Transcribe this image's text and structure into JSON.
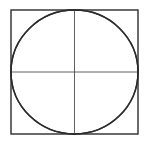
{
  "figure": {
    "background_color": "#ffffff",
    "stroke_color": "#2b2b2b",
    "thin_stroke_color": "#4f4f4f",
    "canvas": {
      "width": 147,
      "height": 146
    }
  },
  "geometry": {
    "square": {
      "name": "bounding-square",
      "left": 11,
      "top": 10,
      "right": 138,
      "bottom": 134,
      "width": 127,
      "height": 124,
      "stroke_width": 1.4
    },
    "circle": {
      "name": "inscribed-circle",
      "center_x": 74.5,
      "center_y": 72,
      "radius_x": 63.5,
      "radius_y": 62,
      "stroke_width": 1.4
    },
    "axes": {
      "name": "center-cross",
      "center_x": 74.5,
      "center_y": 72,
      "stroke_width": 0.9,
      "horizontal": {
        "x1": 11,
        "y1": 72,
        "x2": 138,
        "y2": 72
      },
      "vertical": {
        "x1": 74.5,
        "y1": 10,
        "x2": 74.5,
        "y2": 134
      }
    },
    "corner_arcs": {
      "name": "four-corner-quarter-arcs",
      "description": "Quarter circles centred on each square corner, radius equal to half the side, meeting at the circle's cardinal points and forming a concave four-pointed star",
      "stroke_width": 1.4,
      "arcs": [
        {
          "id": "arc-top-left",
          "center": [
            11,
            10
          ],
          "from": [
            11,
            72
          ],
          "to": [
            74.5,
            10
          ]
        },
        {
          "id": "arc-top-right",
          "center": [
            138,
            10
          ],
          "from": [
            74.5,
            10
          ],
          "to": [
            138,
            72
          ]
        },
        {
          "id": "arc-bottom-right",
          "center": [
            138,
            134
          ],
          "from": [
            138,
            72
          ],
          "to": [
            74.5,
            134
          ]
        },
        {
          "id": "arc-bottom-left",
          "center": [
            11,
            134
          ],
          "from": [
            74.5,
            134
          ],
          "to": [
            11,
            72
          ]
        }
      ]
    },
    "cusp_points": [
      {
        "id": "cusp-top",
        "x": 74.5,
        "y": 10
      },
      {
        "id": "cusp-right",
        "x": 138,
        "y": 72
      },
      {
        "id": "cusp-bottom",
        "x": 74.5,
        "y": 134
      },
      {
        "id": "cusp-left",
        "x": 11,
        "y": 72
      }
    ]
  },
  "labels": {
    "none": ""
  }
}
